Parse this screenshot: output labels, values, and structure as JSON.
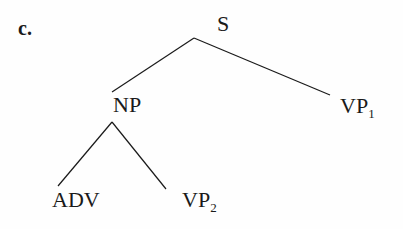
{
  "example_label": "c.",
  "tree": {
    "nodes": [
      {
        "id": "S",
        "label": "S",
        "subscript": ""
      },
      {
        "id": "NP",
        "label": "NP",
        "subscript": ""
      },
      {
        "id": "VP1",
        "label": "VP",
        "subscript": "1"
      },
      {
        "id": "ADV",
        "label": "ADV",
        "subscript": ""
      },
      {
        "id": "VP2",
        "label": "VP",
        "subscript": "2"
      }
    ],
    "edges": [
      {
        "from": "S",
        "to": "NP"
      },
      {
        "from": "S",
        "to": "VP1"
      },
      {
        "from": "NP",
        "to": "ADV"
      },
      {
        "from": "NP",
        "to": "VP2"
      }
    ]
  },
  "colors": {
    "ink": "#1a1a1a",
    "background": "#fefefe"
  }
}
